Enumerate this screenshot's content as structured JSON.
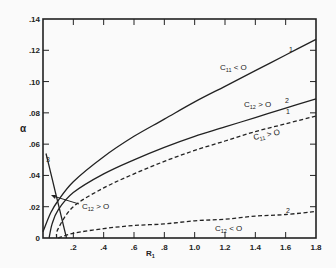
{
  "chart_data": {
    "type": "line",
    "title": "",
    "xlabel": "R1",
    "ylabel": "α",
    "xlim": [
      0,
      1.8
    ],
    "ylim": [
      0,
      0.14
    ],
    "x_ticks": [
      "0",
      ".2",
      ".4",
      ".6",
      ".8",
      "1.0",
      "1.2",
      "1.4",
      "1.6",
      "1.8"
    ],
    "y_ticks": [
      "0",
      ".02",
      ".04",
      ".06",
      ".08",
      ".10",
      ".12",
      ".14"
    ],
    "grid": false,
    "legend": "none (inline annotations)",
    "series": [
      {
        "name": "1",
        "condition": "C11 < 0",
        "style": "solid",
        "x": [
          0.0,
          0.05,
          0.1,
          0.2,
          0.4,
          0.6,
          0.8,
          1.0,
          1.2,
          1.4,
          1.6,
          1.8
        ],
        "y": [
          0.004,
          0.016,
          0.024,
          0.036,
          0.052,
          0.065,
          0.076,
          0.087,
          0.097,
          0.107,
          0.117,
          0.127
        ]
      },
      {
        "name": "2",
        "condition": "C12 > 0",
        "style": "solid",
        "x": [
          0.04,
          0.06,
          0.1,
          0.2,
          0.4,
          0.6,
          0.8,
          1.0,
          1.2,
          1.4,
          1.6,
          1.8
        ],
        "y": [
          0.0,
          0.009,
          0.018,
          0.029,
          0.041,
          0.05,
          0.058,
          0.065,
          0.071,
          0.077,
          0.083,
          0.089
        ]
      },
      {
        "name": "1",
        "condition": "C11 > 0",
        "style": "dashed",
        "x": [
          0.09,
          0.1,
          0.2,
          0.4,
          0.6,
          0.8,
          1.0,
          1.2,
          1.4,
          1.6,
          1.8
        ],
        "y": [
          0.0,
          0.006,
          0.02,
          0.032,
          0.041,
          0.049,
          0.056,
          0.062,
          0.068,
          0.073,
          0.078
        ]
      },
      {
        "name": "2",
        "condition": "C12 < 0",
        "style": "dashed",
        "x": [
          0.1,
          0.2,
          0.4,
          0.6,
          0.8,
          1.0,
          1.2,
          1.4,
          1.6,
          1.8
        ],
        "y": [
          0.0,
          0.003,
          0.006,
          0.008,
          0.009,
          0.011,
          0.012,
          0.014,
          0.015,
          0.017
        ]
      },
      {
        "name": "3",
        "condition": "",
        "style": "solid",
        "x": [
          0.02,
          0.05,
          0.08,
          0.11,
          0.14,
          0.155
        ],
        "y": [
          0.054,
          0.042,
          0.03,
          0.018,
          0.006,
          0.0
        ]
      }
    ],
    "annotations": [
      {
        "text": "C11 < 0",
        "near": "curve 1 solid"
      },
      {
        "text": "C12 > 0",
        "near": "curve 2 solid"
      },
      {
        "text": "C11 > 0",
        "near": "curve 1 dashed"
      },
      {
        "text": "C12 < 0",
        "near": "curve 2 dashed"
      },
      {
        "text": "C12 > 0",
        "near": "intersection near R1≈0.1, α≈0.025 (arrow)"
      },
      {
        "text": "3",
        "near": "steep curve at left"
      }
    ]
  },
  "labels": {
    "ylabel": "α",
    "xlabel_main": "R",
    "xlabel_sub": "1",
    "c11_neg": {
      "main": "C",
      "sub": "11",
      "rel": " < O"
    },
    "c12_pos": {
      "main": "C",
      "sub": "12",
      "rel": " > O"
    },
    "c11_pos": {
      "main": "C",
      "sub": "11",
      "rel": " > O"
    },
    "c12_neg": {
      "main": "C",
      "sub": "12",
      "rel": " < O"
    },
    "c12_pos_arrow": {
      "main": "C",
      "sub": "12",
      "rel": " > O"
    },
    "curve_num_1a": "1",
    "curve_num_2a": "2",
    "curve_num_1b": "1",
    "curve_num_2b": "2",
    "curve_num_3": "3"
  },
  "colors": {
    "ink": "#222222",
    "background": "#fafafa"
  }
}
